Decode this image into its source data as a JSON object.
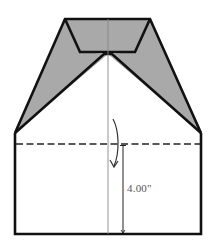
{
  "diagram": {
    "type": "folding-instruction",
    "dimension_label": "4.00\"",
    "colors": {
      "outline": "#111111",
      "shade": "#a9a9a9",
      "center_line": "#888888",
      "dash": "#222222",
      "arrow": "#333333"
    },
    "shapes": {
      "top_edge": {
        "x1": 65,
        "y1": 19,
        "x2": 150,
        "y2": 19
      },
      "inner_trapezoid_bottom": {
        "x1": 80,
        "y1": 52,
        "x2": 135,
        "y2": 52
      },
      "apex": {
        "x": 108,
        "y": 54
      },
      "left_corner": {
        "x": 15,
        "y": 133
      },
      "right_corner": {
        "x": 201,
        "y": 133
      },
      "bottom_left": {
        "x": 15,
        "y": 234
      },
      "bottom_right": {
        "x": 201,
        "y": 234
      },
      "fold_line_y": 144,
      "center_x": 108,
      "dimension_x": 123
    }
  }
}
